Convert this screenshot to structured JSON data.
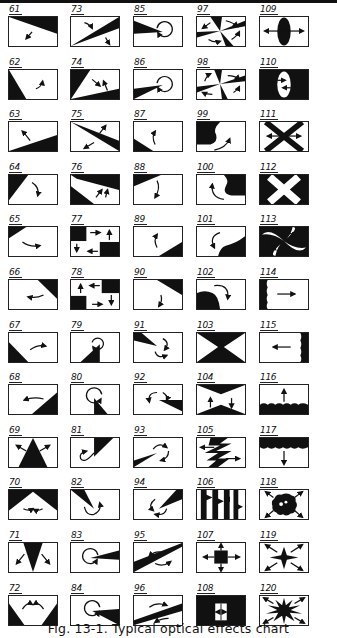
{
  "figure": {
    "caption": "Fig. 13-1. Typical optical effects chart",
    "ink_color": "#111111",
    "paper_color": "#ffffff",
    "columns": 5,
    "rows": 12
  },
  "effects": [
    {
      "n": "61",
      "desc": "diagonal wipe from top-right, arrow down-left"
    },
    {
      "n": "62",
      "desc": "diagonal wipe from bottom-left, arrow up-right"
    },
    {
      "n": "63",
      "desc": "diagonal wipe from bottom, arrow up-left"
    },
    {
      "n": "64",
      "desc": "triangle wipe top-left, curved arrow down"
    },
    {
      "n": "65",
      "desc": "small corner wipe top-left, curved arrow right"
    },
    {
      "n": "66",
      "desc": "corner wipe top-right, curved arrow left"
    },
    {
      "n": "67",
      "desc": "corner wipe bottom-left, curved arrow right"
    },
    {
      "n": "68",
      "desc": "corner wipe bottom-right, curved arrow left"
    },
    {
      "n": "69",
      "desc": "triangle up from bottom center, arrows out"
    },
    {
      "n": "70",
      "desc": "inverted V from top corners, arrows inward"
    },
    {
      "n": "71",
      "desc": "V from top center, arrows out"
    },
    {
      "n": "72",
      "desc": "V wipe from bottom corners, arrows inward"
    },
    {
      "n": "73",
      "desc": "wedge from bottom-left, arrows apart"
    },
    {
      "n": "74",
      "desc": "two wedges, arrows converging"
    },
    {
      "n": "75",
      "desc": "wedge from top-left, arrows apart"
    },
    {
      "n": "76",
      "desc": "two wedges, arrows up"
    },
    {
      "n": "77",
      "desc": "squares top-left and bottom-right, arrows circulate"
    },
    {
      "n": "78",
      "desc": "squares top-right and bottom-left, arrows circulate"
    },
    {
      "n": "79",
      "desc": "triangle from bottom, circular arrow"
    },
    {
      "n": "80",
      "desc": "triangle center-bottom, circular arrow"
    },
    {
      "n": "81",
      "desc": "triangle from top, circular arrow"
    },
    {
      "n": "82",
      "desc": "triangle from top-left, circular arrow"
    },
    {
      "n": "83",
      "desc": "wedge from right, circular arrow"
    },
    {
      "n": "84",
      "desc": "wedge lower right, circular arrow"
    },
    {
      "n": "85",
      "desc": "wedge from left, circular arrow"
    },
    {
      "n": "86",
      "desc": "wedge lower left, circular arrow"
    },
    {
      "n": "87",
      "desc": "corner bottom-left, arrow up"
    },
    {
      "n": "88",
      "desc": "corner top-left, arrow down"
    },
    {
      "n": "89",
      "desc": "corner bottom-right, arrow up"
    },
    {
      "n": "90",
      "desc": "corner top-right, arrow down"
    },
    {
      "n": "91",
      "desc": "wedge top-left, circular arrows"
    },
    {
      "n": "92",
      "desc": "wedge from right, circular arrows"
    },
    {
      "n": "93",
      "desc": "wedge bottom-left, circular arrows"
    },
    {
      "n": "94",
      "desc": "wedge top-right, circular arrows"
    },
    {
      "n": "95",
      "desc": "bow tie diagonal, circular arrows"
    },
    {
      "n": "96",
      "desc": "bow tie diagonal reversed, circular arrows"
    },
    {
      "n": "97",
      "desc": "pinwheel, arrows rotating"
    },
    {
      "n": "98",
      "desc": "pinwheel reversed, arrows rotating"
    },
    {
      "n": "99",
      "desc": "curl wipe, arrow"
    },
    {
      "n": "100",
      "desc": "curl wipe right, arrow"
    },
    {
      "n": "101",
      "desc": "curl wipe bottom-right, arrow"
    },
    {
      "n": "102",
      "desc": "curl wipe bottom-left, arrow"
    },
    {
      "n": "103",
      "desc": "hourglass dark, arrows vertical"
    },
    {
      "n": "104",
      "desc": "hourglass light, arrows vertical"
    },
    {
      "n": "105",
      "desc": "zig-zag band, arrows horizontal"
    },
    {
      "n": "106",
      "desc": "vertical stripes, arrows"
    },
    {
      "n": "107",
      "desc": "center square expand, arrows out"
    },
    {
      "n": "108",
      "desc": "dark with center window, arrows"
    },
    {
      "n": "109",
      "desc": "vertical ellipse, arrows out"
    },
    {
      "n": "110",
      "desc": "light ellipse on dark, arrows in"
    },
    {
      "n": "111",
      "desc": "X cross, arrows horizontal"
    },
    {
      "n": "112",
      "desc": "white X on dark"
    },
    {
      "n": "113",
      "desc": "swirl pinwheel"
    },
    {
      "n": "114",
      "desc": "ragged edge left, arrow right"
    },
    {
      "n": "115",
      "desc": "ragged edge right, arrow left"
    },
    {
      "n": "116",
      "desc": "ragged edge bottom, arrow up"
    },
    {
      "n": "117",
      "desc": "ragged edge top, arrow down"
    },
    {
      "n": "118",
      "desc": "blob center, arrows out"
    },
    {
      "n": "119",
      "desc": "four-point star, arrows out"
    },
    {
      "n": "120",
      "desc": "many-point star burst, arrows out"
    }
  ]
}
